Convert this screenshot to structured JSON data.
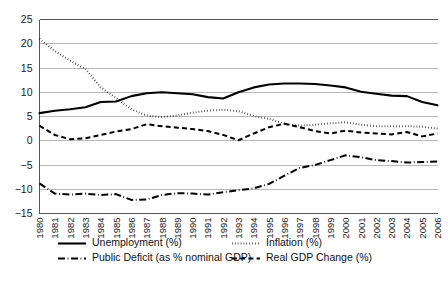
{
  "chart_data": {
    "type": "line",
    "title": "",
    "xlabel": "",
    "ylabel": "",
    "ylim": [
      -15,
      25
    ],
    "ytick_step": 5,
    "yticks": [
      25,
      20,
      15,
      10,
      5,
      0,
      -5,
      -10,
      -15
    ],
    "ytick_labels": [
      "25",
      "20",
      "15",
      "10",
      "5",
      "0",
      "−5",
      "−10",
      "−15"
    ],
    "grid": true,
    "grid_axis": "y",
    "legend_position": "bottom",
    "categories": [
      "1980",
      "1981",
      "1982",
      "1983",
      "1984",
      "1985",
      "1986",
      "1987",
      "1988",
      "1989",
      "1990",
      "1991",
      "1992",
      "1993",
      "1994",
      "1995",
      "1996",
      "1997",
      "1998",
      "1999",
      "2000",
      "2001",
      "2002",
      "2003",
      "2004",
      "2005",
      "2006"
    ],
    "series": [
      {
        "name": "Unemployment (%)",
        "style": "solid",
        "color": "#000000",
        "values": [
          5.7,
          6.2,
          6.5,
          6.9,
          8.0,
          8.1,
          9.2,
          9.8,
          10.0,
          9.8,
          9.6,
          9.0,
          8.7,
          10.0,
          11.0,
          11.6,
          11.8,
          11.8,
          11.7,
          11.4,
          11.0,
          10.1,
          9.7,
          9.3,
          9.2,
          8.0,
          7.3
        ]
      },
      {
        "name": "Inflation (%)",
        "style": "dotted",
        "color": "#000000",
        "values": [
          21.0,
          18.5,
          16.5,
          14.8,
          11.0,
          8.8,
          6.5,
          5.2,
          4.9,
          5.2,
          5.8,
          6.2,
          6.4,
          6.1,
          5.1,
          4.5,
          3.5,
          3.1,
          3.3,
          3.6,
          3.8,
          3.3,
          3.0,
          3.0,
          3.0,
          2.9,
          2.5
        ]
      },
      {
        "name": "Public Deficit (as % nominal GDP)",
        "style": "dashdot",
        "color": "#000000",
        "values": [
          -8.8,
          -10.9,
          -11.1,
          -10.9,
          -11.2,
          -11.0,
          -12.2,
          -12.1,
          -11.2,
          -10.8,
          -10.9,
          -11.1,
          -10.6,
          -10.2,
          -9.8,
          -8.9,
          -7.2,
          -5.6,
          -5.0,
          -4.0,
          -3.0,
          -3.4,
          -4.0,
          -4.2,
          -4.5,
          -4.4,
          -4.3
        ]
      },
      {
        "name": "Real GDP Change (%)",
        "style": "dashed",
        "color": "#000000",
        "values": [
          3.1,
          1.2,
          0.3,
          0.5,
          1.2,
          1.9,
          2.4,
          3.4,
          3.0,
          2.7,
          2.4,
          2.0,
          1.2,
          0.1,
          1.5,
          2.8,
          3.5,
          2.8,
          2.0,
          1.5,
          2.1,
          1.7,
          1.5,
          1.3,
          1.8,
          0.9,
          1.5
        ]
      }
    ]
  },
  "caption": {
    "text": ""
  }
}
